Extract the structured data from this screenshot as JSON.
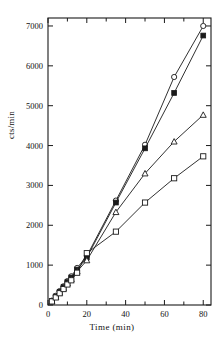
{
  "chart_data": {
    "type": "line",
    "title": "",
    "subtitle": "",
    "xlabel": "Time (min)",
    "ylabel": "cts/min",
    "xlim": [
      0,
      84
    ],
    "ylim": [
      0,
      7200
    ],
    "xticks": [
      0,
      20,
      40,
      60,
      80
    ],
    "xtick_labels": [
      "0",
      "20",
      "40",
      "60",
      "80"
    ],
    "xminor_ticks": [
      10,
      30,
      50,
      70
    ],
    "yticks": [
      0,
      1000,
      2000,
      3000,
      4000,
      5000,
      6000,
      7000
    ],
    "ytick_labels": [
      "0",
      "1000",
      "2000",
      "3000",
      "4000",
      "5000",
      "6000",
      "7000"
    ],
    "grid": false,
    "legend": "none",
    "frame": "box",
    "tick_direction": "in",
    "line_color": "#1a1a1a",
    "series": [
      {
        "name": "series-open-circle",
        "marker": "open-circle",
        "filled": false,
        "x": [
          2,
          4,
          6,
          8,
          10,
          12,
          15,
          20,
          35,
          50,
          65,
          80
        ],
        "y": [
          110,
          230,
          350,
          470,
          600,
          720,
          930,
          1230,
          2620,
          4020,
          5720,
          7000
        ]
      },
      {
        "name": "series-filled-square",
        "marker": "filled-square",
        "filled": true,
        "x": [
          2,
          4,
          6,
          8,
          10,
          12,
          15,
          20,
          35,
          50,
          65,
          80
        ],
        "y": [
          100,
          215,
          330,
          450,
          575,
          690,
          890,
          1190,
          2570,
          3930,
          5320,
          6760
        ]
      },
      {
        "name": "series-open-triangle",
        "marker": "open-triangle",
        "filled": false,
        "x": [
          2,
          4,
          6,
          8,
          10,
          12,
          15,
          20,
          35,
          50,
          65,
          80
        ],
        "y": [
          95,
          200,
          310,
          420,
          540,
          650,
          840,
          1120,
          2330,
          3300,
          4100,
          4770
        ]
      },
      {
        "name": "series-open-square",
        "marker": "open-square",
        "filled": false,
        "x": [
          2,
          4,
          6,
          8,
          10,
          12,
          15,
          20,
          35,
          50,
          65,
          80
        ],
        "y": [
          90,
          190,
          295,
          400,
          515,
          620,
          810,
          1300,
          1840,
          2570,
          3180,
          3730
        ]
      }
    ]
  },
  "figure": {
    "xaxis_label": "Time (min)",
    "yaxis_label": "cts/min"
  }
}
